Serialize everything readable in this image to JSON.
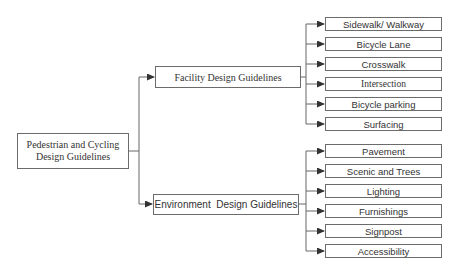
{
  "diagram": {
    "type": "tree",
    "root": {
      "label": "Pedestrian and Cycling Design Guidelines",
      "label_lines": [
        "Pedestrian and Cycling",
        "Design Guidelines"
      ]
    },
    "branches": [
      {
        "label": "Facility Design Guidelines",
        "children": [
          "Sidewalk/ Walkway",
          "Bicycle Lane",
          "Crosswalk",
          "Intersection",
          "Bicycle parking",
          "Surfacing"
        ]
      },
      {
        "label": "Environment  Design Guidelines",
        "children": [
          "Pavement",
          "Scenic and Trees",
          "Lighting",
          "Furnishings",
          "Signpost",
          "Accessibility"
        ]
      }
    ]
  },
  "colors": {
    "line": "#555555",
    "border": "#6b6b6b",
    "text": "#333333",
    "background": "#ffffff"
  }
}
